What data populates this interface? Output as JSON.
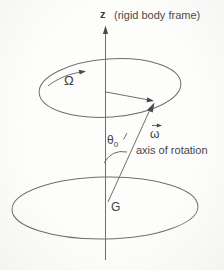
{
  "figure": {
    "labels": {
      "z_axis": "z",
      "frame_note": "(rigid body frame)",
      "precession_rate": "Ω",
      "angular_velocity": "ω",
      "theta_symbol": "θ",
      "theta_subscript": "0",
      "axis_note": "axis of rotation",
      "center_of_mass": "G"
    },
    "colors": {
      "line": "#6e6e6e",
      "arrowhead": "#4a4a4a",
      "text": "#474747",
      "background": "#fcfcfa"
    }
  }
}
